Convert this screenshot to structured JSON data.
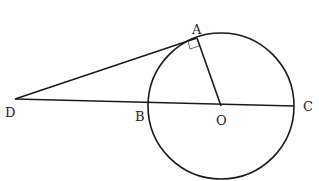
{
  "diagram": {
    "type": "geometry",
    "points": {
      "A": {
        "label": "A",
        "x": 197,
        "y": 38
      },
      "B": {
        "label": "B",
        "x": 148,
        "y": 105
      },
      "C": {
        "label": "C",
        "x": 294,
        "y": 106
      },
      "D": {
        "label": "D",
        "x": 15,
        "y": 99
      },
      "O": {
        "label": "O",
        "x": 221,
        "y": 106
      }
    },
    "circle": {
      "center": "O",
      "cx": 221,
      "cy": 106,
      "r": 73
    },
    "segments": [
      "DA",
      "DC",
      "OA"
    ],
    "right_angle_at": "A",
    "stroke_color": "#1a1a1a"
  }
}
